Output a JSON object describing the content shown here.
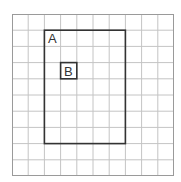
{
  "diagram": {
    "grid": {
      "columns": 10,
      "rows": 10,
      "line_color": "#bdbdbd",
      "border_color": "#888888"
    },
    "shapes": [
      {
        "label": "A",
        "col": 2,
        "row": 1,
        "width_cells": 5,
        "height_cells": 7
      },
      {
        "label": "B",
        "col": 3,
        "row": 3,
        "width_cells": 1,
        "height_cells": 1
      }
    ]
  }
}
